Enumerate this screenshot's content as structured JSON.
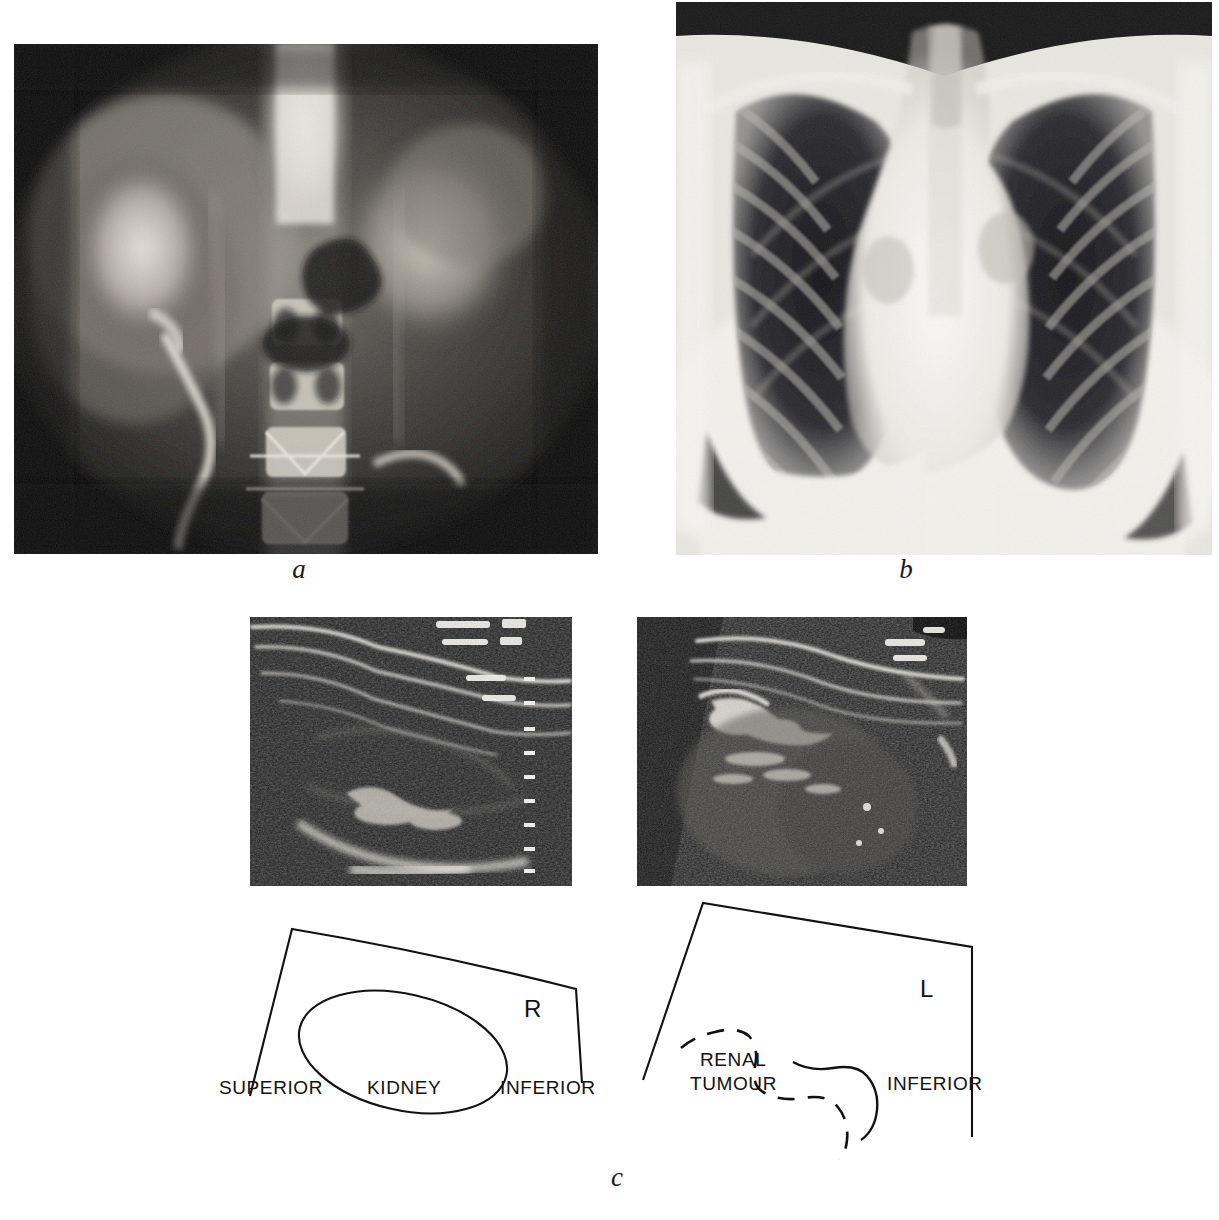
{
  "figure": {
    "kind": "medical-imaging-figure",
    "background_color": "#ffffff",
    "ink_color": "#111111"
  },
  "panels": [
    {
      "id": "a",
      "letter": "a",
      "modality": "radiograph",
      "description": "intravenous-urogram-abdominal-radiograph",
      "bounds": {
        "x": 14,
        "y": 44,
        "width": 584,
        "height": 510
      }
    },
    {
      "id": "b",
      "letter": "b",
      "modality": "radiograph",
      "description": "chest-radiograph-pa-view",
      "bounds": {
        "x": 676,
        "y": 2,
        "width": 536,
        "height": 553
      }
    },
    {
      "id": "c-left",
      "letter": "",
      "modality": "ultrasound",
      "description": "ultrasound-longitudinal-right-kidney",
      "bounds": {
        "x": 250,
        "y": 617,
        "width": 322,
        "height": 269
      }
    },
    {
      "id": "c-right",
      "letter": "",
      "modality": "ultrasound",
      "description": "ultrasound-longitudinal-left-renal-tumour",
      "bounds": {
        "x": 637,
        "y": 617,
        "width": 330,
        "height": 269
      }
    }
  ],
  "panel_letters": [
    {
      "name": "panel-letter-a",
      "text": "a",
      "x": 279,
      "y": 556
    },
    {
      "name": "panel-letter-b",
      "text": "b",
      "x": 886,
      "y": 556
    },
    {
      "name": "panel-letter-c",
      "text": "c",
      "x": 597,
      "y": 1164
    }
  ],
  "diagrams": {
    "left": {
      "name": "diagram-right-kidney",
      "side_marker": "R",
      "side_marker_pos": {
        "x": 524,
        "y": 1000
      },
      "labels": [
        {
          "name": "label-superior",
          "text": "SUPERIOR",
          "x": 219,
          "y": 1076
        },
        {
          "name": "label-kidney",
          "text": "KIDNEY",
          "x": 367,
          "y": 1076
        },
        {
          "name": "label-inferior",
          "text": "INFERIOR",
          "x": 500,
          "y": 1076
        }
      ],
      "outline_note": "scan-sector-outline-with-kidney-ellipse",
      "kidney_outline_style": "solid"
    },
    "right": {
      "name": "diagram-left-renal-tumour",
      "side_marker": "L",
      "side_marker_pos": {
        "x": 920,
        "y": 985
      },
      "labels": [
        {
          "name": "label-renal-tumour-line1",
          "text": "RENAL",
          "x": 700,
          "y": 1048
        },
        {
          "name": "label-renal-tumour-line2",
          "text": "TUMOUR",
          "x": 690,
          "y": 1072
        },
        {
          "name": "label-inferior",
          "text": "INFERIOR",
          "x": 887,
          "y": 1072
        }
      ],
      "outline_note": "scan-sector-outline-with-dashed-tumour-margin",
      "tumour_outline_style": "dashed"
    }
  }
}
